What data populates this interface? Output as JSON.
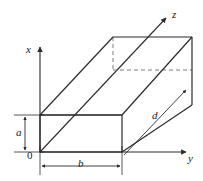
{
  "figure": {
    "kind": "3d-rectangular-waveguide-diagram",
    "background_color": "#ffffff",
    "line_color": "#2b2b2b",
    "hidden_line_color": "#6e6e6e",
    "axes": [
      {
        "id": "x",
        "label": "x",
        "orientation": "vertical-up",
        "label_x": 26,
        "label_y": 50
      },
      {
        "id": "y",
        "label": "y",
        "orientation": "horizontal-right",
        "label_x": 188,
        "label_y": 158
      },
      {
        "id": "z",
        "label": "z",
        "orientation": "diagonal-up-right",
        "label_x": 172,
        "label_y": 14
      }
    ],
    "origin": {
      "label": "0",
      "label_x": 27,
      "label_y": 152
    },
    "dimensions": [
      {
        "id": "a",
        "label": "a",
        "kind": "vertical-double-arrow",
        "label_x": 19,
        "label_y": 126
      },
      {
        "id": "b",
        "label": "b",
        "kind": "horizontal-double-arrow",
        "label_x": 78,
        "label_y": 160
      },
      {
        "id": "d",
        "label": "d",
        "kind": "diagonal-double-arrow",
        "label_x": 155,
        "label_y": 110
      }
    ]
  }
}
